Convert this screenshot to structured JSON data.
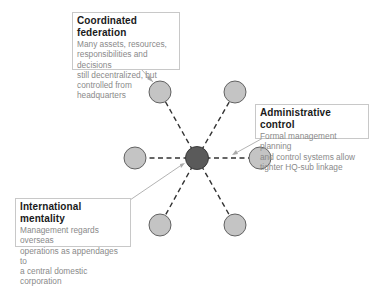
{
  "diagram": {
    "type": "hub-and-spoke",
    "center_node": {
      "label": "headquarters",
      "color": "#5a5a5a"
    },
    "outer_nodes_count": 6,
    "outer_node_color": "#c4c4c4",
    "connector_style": "dashed",
    "callouts": [
      {
        "title": "Coordinated federation",
        "lines": [
          "Many assets, resources,",
          "responsibilities and decisions",
          "still decentralized, but",
          "controlled from headquarters"
        ]
      },
      {
        "title": "Administrative control",
        "lines": [
          "Formal management planning",
          "and control systems allow",
          "tighter HQ-sub linkage"
        ]
      },
      {
        "title": "International mentality",
        "lines": [
          "Management regards overseas",
          "operations as appendages to",
          "a central domestic corporation"
        ]
      }
    ]
  }
}
